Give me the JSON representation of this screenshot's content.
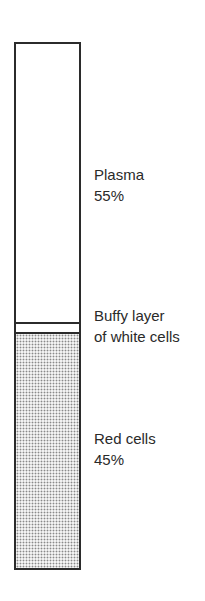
{
  "diagram": {
    "layers": [
      {
        "name": "Plasma",
        "percent": "55%"
      },
      {
        "name": "Buffy layer",
        "detail": "of white cells"
      },
      {
        "name": "Red cells",
        "percent": "45%"
      }
    ],
    "colors": {
      "outline": "#2b2b2b",
      "stipple": "#8a8a8a",
      "background": "#ffffff"
    }
  }
}
